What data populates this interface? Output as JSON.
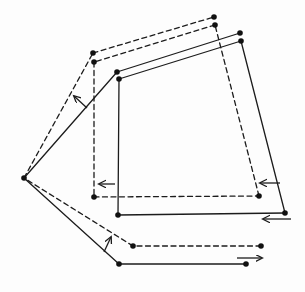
{
  "diagram": {
    "width": 305,
    "height": 292,
    "background": "#fdfdfd",
    "stroke_color": "#1c1c1c",
    "dot_color": "#111111",
    "stroke_width": 1.3,
    "dot_radius": 2.8,
    "dash_pattern": "5 3.5",
    "points": {
      "A": [
        246,
        264
      ],
      "B": [
        119,
        264
      ],
      "C": [
        24,
        178
      ],
      "D": [
        117,
        72
      ],
      "E": [
        240,
        33
      ],
      "F": [
        241,
        41
      ],
      "G": [
        119,
        79
      ],
      "H": [
        118,
        215
      ],
      "I": [
        285,
        213
      ],
      "A2": [
        261,
        246
      ],
      "B2": [
        133,
        246
      ],
      "D2": [
        93,
        53
      ],
      "E2": [
        214,
        17
      ],
      "F2": [
        215,
        25
      ],
      "G2": [
        94,
        62
      ],
      "H2": [
        94,
        197
      ],
      "I2": [
        259,
        196
      ]
    },
    "solid_edges": [
      [
        "A",
        "B"
      ],
      [
        "B",
        "C"
      ],
      [
        "C",
        "D"
      ],
      [
        "D",
        "E"
      ],
      [
        "F",
        "G"
      ],
      [
        "G",
        "H"
      ],
      [
        "H",
        "I"
      ],
      [
        "I",
        "F"
      ]
    ],
    "dashed_edges": [
      [
        "A2",
        "B2"
      ],
      [
        "B2",
        "C"
      ],
      [
        "C",
        "D2"
      ],
      [
        "D2",
        "E2"
      ],
      [
        "F2",
        "G2"
      ],
      [
        "G2",
        "H2"
      ],
      [
        "H2",
        "I2"
      ],
      [
        "I2",
        "F2"
      ]
    ],
    "arrows": [
      {
        "name": "arrow-up-left-upper-link",
        "direction": "up-left",
        "from": [
          87,
          108
        ],
        "to": [
          74,
          96
        ]
      },
      {
        "name": "arrow-left-inner-vertical",
        "direction": "left",
        "from": [
          115,
          184
        ],
        "to": [
          99,
          184
        ]
      },
      {
        "name": "arrow-left-right-slant",
        "direction": "left",
        "from": [
          280,
          183
        ],
        "to": [
          260,
          183
        ]
      },
      {
        "name": "arrow-left-bottom-corner",
        "direction": "left",
        "from": [
          291,
          219
        ],
        "to": [
          263,
          219
        ]
      },
      {
        "name": "arrow-up-right-lower-link",
        "direction": "up-right",
        "from": [
          104,
          252
        ],
        "to": [
          111,
          237
        ]
      },
      {
        "name": "arrow-right-bottom-segment",
        "direction": "right",
        "from": [
          237,
          258
        ],
        "to": [
          262,
          258
        ]
      }
    ]
  }
}
